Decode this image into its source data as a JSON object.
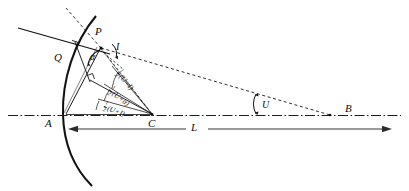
{
  "figure": {
    "type": "optical-ray-diagram"
  },
  "points": {
    "P": "P",
    "Q": "Q",
    "A": "A",
    "C": "C",
    "B": "B"
  },
  "angles": {
    "alpha": "α",
    "I": "I",
    "U": "U"
  },
  "distance_label": {
    "L": "L"
  },
  "fractions": [
    {
      "coef_num": "1",
      "coef_den": "2",
      "expr": "(U+I)"
    },
    {
      "coef_num": "1",
      "coef_den": "2",
      "expr": "(U+α)"
    },
    {
      "coef_num": "1",
      "coef_den": "2",
      "expr": "(U+I)"
    }
  ],
  "colors": {
    "stroke": "#0f0f0f",
    "background": "#ffffff",
    "axis": "#2a2a2a"
  }
}
